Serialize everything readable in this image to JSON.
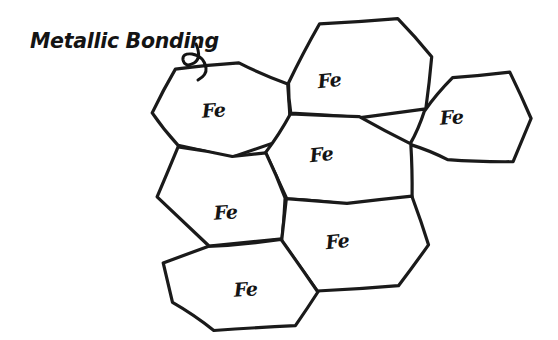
{
  "canvas": {
    "width": 558,
    "height": 340,
    "background_color": "#ffffff",
    "ink_color": "#1a1a1a",
    "style": "hand-drawn pencil sketch"
  },
  "title": {
    "text": "Metallic Bonding",
    "x": 30,
    "y": 48
  },
  "diagram": {
    "cell_label": "Fe",
    "cell_count": 7,
    "cells": [
      {
        "id": "cell-top-left",
        "label": "Fe",
        "label_x": 214,
        "label_y": 117,
        "points": "176,70 238,63 288,84 290,136 232,157 179,146 152,113"
      },
      {
        "id": "cell-top-middle",
        "label": "Fe",
        "label_x": 330,
        "label_y": 87,
        "points": "288,84 320,24 398,18 432,56 425,110 360,117 290,113"
      },
      {
        "id": "cell-top-right",
        "label": "Fe",
        "label_x": 452,
        "label_y": 124,
        "points": "425,110 452,78 510,73 530,118 513,162 448,160 411,144"
      },
      {
        "id": "cell-center",
        "label": "Fe",
        "label_x": 322,
        "label_y": 161,
        "points": "290,113 360,117 411,144 412,197 348,204 286,198 266,152"
      },
      {
        "id": "cell-middle-left",
        "label": "Fe",
        "label_x": 226,
        "label_y": 219,
        "points": "179,146 232,157 266,152 286,198 281,240 209,246 157,196"
      },
      {
        "id": "cell-bottom-middle",
        "label": "Fe",
        "label_x": 338,
        "label_y": 248,
        "points": "286,198 348,204 412,197 428,245 398,286 318,292 281,240"
      },
      {
        "id": "cell-bottom-left",
        "label": "Fe",
        "label_x": 246,
        "label_y": 296,
        "points": "209,246 281,240 318,292 296,326 214,330 172,302 162,264"
      }
    ]
  }
}
